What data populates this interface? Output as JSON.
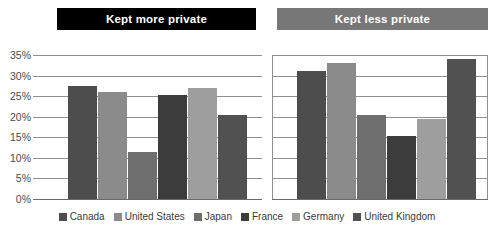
{
  "chart_data": {
    "type": "bar",
    "title": "",
    "xlabel": "",
    "ylabel": "",
    "ylim": [
      0,
      35
    ],
    "grid": true,
    "legend_position": "bottom",
    "panels": [
      {
        "label": "Kept more private",
        "header_color": "#000000",
        "categories": [
          "Canada",
          "United States",
          "Japan",
          "France",
          "Germany",
          "United Kingdom"
        ],
        "values": [
          27.5,
          26,
          11.5,
          25.2,
          27,
          20.3
        ]
      },
      {
        "label": "Kept less private",
        "header_color": "#777777",
        "categories": [
          "Canada",
          "United States",
          "Japan",
          "France",
          "Germany",
          "United Kingdom"
        ],
        "values": [
          31,
          33,
          20.3,
          15.3,
          19.5,
          34
        ]
      }
    ],
    "yticks": [
      "35%",
      "30%",
      "25%",
      "20%",
      "15%",
      "10%",
      "5%",
      "0%"
    ],
    "ytick_values": [
      35,
      30,
      25,
      20,
      15,
      10,
      5,
      0
    ],
    "series_colors": {
      "Canada": "#4d4d4d",
      "United States": "#8b8b8b",
      "Japan": "#6e6e6e",
      "France": "#3c3c3c",
      "Germany": "#9e9e9e",
      "United Kingdom": "#515151"
    },
    "legend": [
      {
        "label": "Canada",
        "color": "#4d4d4d"
      },
      {
        "label": "United States",
        "color": "#8b8b8b"
      },
      {
        "label": "Japan",
        "color": "#6e6e6e"
      },
      {
        "label": "France",
        "color": "#3c3c3c"
      },
      {
        "label": "Germany",
        "color": "#9e9e9e"
      },
      {
        "label": "United Kingdom",
        "color": "#515151"
      }
    ]
  }
}
